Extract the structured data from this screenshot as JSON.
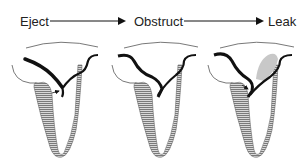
{
  "diagram": {
    "stages": [
      {
        "label": "Eject"
      },
      {
        "label": "Obstruct"
      },
      {
        "label": "Leak"
      }
    ],
    "colors": {
      "stroke": "#111111",
      "hatch_fill": "#9a9a9a",
      "leak_jet": "#c8c8c8",
      "thin_line": "#555555"
    }
  }
}
